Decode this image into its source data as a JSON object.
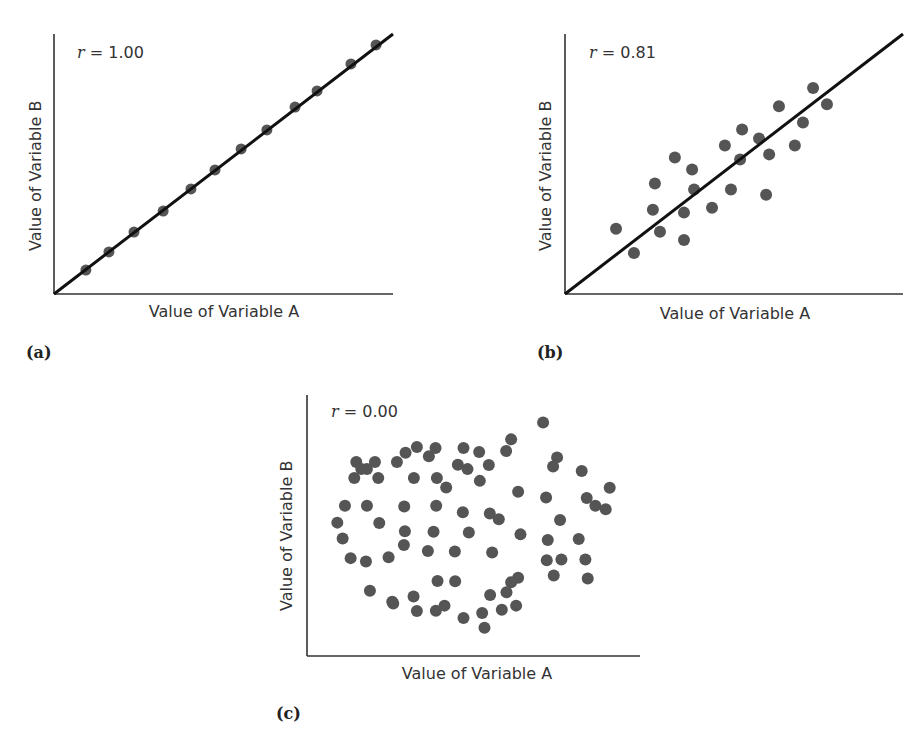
{
  "figure": {
    "panels": [
      {
        "tag": "(a)",
        "r_var": "r",
        "r_value": "= 1.00",
        "xlabel": "Value of Variable A",
        "ylabel": "Value of Variable B"
      },
      {
        "tag": "(b)",
        "r_var": "r",
        "r_value": "= 0.81",
        "xlabel": "Value of Variable A",
        "ylabel": "Value of Variable B"
      },
      {
        "tag": "(c)",
        "r_var": "r",
        "r_value": "= 0.00",
        "xlabel": "Value of Variable A",
        "ylabel": "Value of Variable B"
      }
    ],
    "colors": {
      "point": "#555555",
      "line": "#111111",
      "axis": "#333333"
    }
  },
  "chart_data": [
    {
      "type": "scatter",
      "title": "r = 1.00",
      "panel": "(a)",
      "xlabel": "Value of Variable A",
      "ylabel": "Value of Variable B",
      "xlim": [
        0,
        100
      ],
      "ylim": [
        0,
        100
      ],
      "grid": false,
      "ticks": false,
      "regression_line": {
        "x": [
          0,
          100
        ],
        "y": [
          0,
          100
        ]
      },
      "points": [
        {
          "x": 9.4,
          "y": 9.2
        },
        {
          "x": 16.2,
          "y": 16.2
        },
        {
          "x": 23.6,
          "y": 23.8
        },
        {
          "x": 32.2,
          "y": 31.9
        },
        {
          "x": 40.4,
          "y": 40.4
        },
        {
          "x": 47.5,
          "y": 47.7
        },
        {
          "x": 55.2,
          "y": 55.8
        },
        {
          "x": 62.8,
          "y": 63.1
        },
        {
          "x": 71.1,
          "y": 71.9
        },
        {
          "x": 77.6,
          "y": 78.1
        },
        {
          "x": 87.6,
          "y": 88.5
        },
        {
          "x": 95.0,
          "y": 95.8
        }
      ]
    },
    {
      "type": "scatter",
      "title": "r = 0.81",
      "panel": "(b)",
      "xlabel": "Value of Variable A",
      "ylabel": "Value of Variable B",
      "xlim": [
        0,
        100
      ],
      "ylim": [
        0,
        100
      ],
      "grid": false,
      "ticks": false,
      "regression_line": {
        "x": [
          0,
          100
        ],
        "y": [
          0,
          100
        ]
      },
      "points": [
        {
          "x": 15.1,
          "y": 25.1
        },
        {
          "x": 20.4,
          "y": 15.8
        },
        {
          "x": 26.0,
          "y": 32.4
        },
        {
          "x": 26.6,
          "y": 42.5
        },
        {
          "x": 28.1,
          "y": 23.9
        },
        {
          "x": 32.5,
          "y": 52.5
        },
        {
          "x": 35.2,
          "y": 20.8
        },
        {
          "x": 35.2,
          "y": 31.3
        },
        {
          "x": 37.6,
          "y": 47.9
        },
        {
          "x": 38.2,
          "y": 40.2
        },
        {
          "x": 43.5,
          "y": 33.2
        },
        {
          "x": 47.3,
          "y": 57.1
        },
        {
          "x": 49.1,
          "y": 40.2
        },
        {
          "x": 51.8,
          "y": 51.7
        },
        {
          "x": 52.4,
          "y": 63.3
        },
        {
          "x": 57.4,
          "y": 59.8
        },
        {
          "x": 59.5,
          "y": 38.2
        },
        {
          "x": 60.4,
          "y": 53.7
        },
        {
          "x": 63.3,
          "y": 72.2
        },
        {
          "x": 68.0,
          "y": 57.1
        },
        {
          "x": 70.4,
          "y": 66.0
        },
        {
          "x": 73.4,
          "y": 79.2
        },
        {
          "x": 77.5,
          "y": 73.0
        }
      ]
    },
    {
      "type": "scatter",
      "title": "r = 0.00",
      "panel": "(c)",
      "xlabel": "Value of Variable A",
      "ylabel": "Value of Variable B",
      "xlim": [
        0,
        100
      ],
      "ylim": [
        0,
        100
      ],
      "grid": false,
      "ticks": false,
      "regression_line": null,
      "points": [
        {
          "x": 70.9,
          "y": 89.5
        },
        {
          "x": 61.3,
          "y": 83.0
        },
        {
          "x": 59.8,
          "y": 78.5
        },
        {
          "x": 47.0,
          "y": 79.7
        },
        {
          "x": 51.7,
          "y": 78.2
        },
        {
          "x": 38.6,
          "y": 79.7
        },
        {
          "x": 33.0,
          "y": 80.1
        },
        {
          "x": 29.6,
          "y": 77.9
        },
        {
          "x": 36.6,
          "y": 76.5
        },
        {
          "x": 27.0,
          "y": 74.3
        },
        {
          "x": 20.4,
          "y": 74.3
        },
        {
          "x": 14.8,
          "y": 74.3
        },
        {
          "x": 16.3,
          "y": 71.6
        },
        {
          "x": 18.0,
          "y": 71.6
        },
        {
          "x": 45.3,
          "y": 73.3
        },
        {
          "x": 48.2,
          "y": 71.6
        },
        {
          "x": 54.6,
          "y": 73.2
        },
        {
          "x": 75.1,
          "y": 76.1
        },
        {
          "x": 73.9,
          "y": 72.6
        },
        {
          "x": 82.5,
          "y": 70.9
        },
        {
          "x": 14.2,
          "y": 68.2
        },
        {
          "x": 21.4,
          "y": 68.2
        },
        {
          "x": 32.1,
          "y": 68.2
        },
        {
          "x": 39.0,
          "y": 68.2
        },
        {
          "x": 41.8,
          "y": 64.6
        },
        {
          "x": 51.9,
          "y": 67.1
        },
        {
          "x": 63.4,
          "y": 62.9
        },
        {
          "x": 71.8,
          "y": 60.7
        },
        {
          "x": 84.0,
          "y": 60.5
        },
        {
          "x": 86.6,
          "y": 57.6
        },
        {
          "x": 90.9,
          "y": 64.5
        },
        {
          "x": 89.7,
          "y": 56.2
        },
        {
          "x": 11.4,
          "y": 57.6
        },
        {
          "x": 18.0,
          "y": 57.6
        },
        {
          "x": 29.2,
          "y": 57.3
        },
        {
          "x": 38.8,
          "y": 57.6
        },
        {
          "x": 46.8,
          "y": 55.1
        },
        {
          "x": 54.9,
          "y": 54.6
        },
        {
          "x": 57.6,
          "y": 52.4
        },
        {
          "x": 76.0,
          "y": 52.1
        },
        {
          "x": 9.1,
          "y": 51.1
        },
        {
          "x": 21.7,
          "y": 51.0
        },
        {
          "x": 29.4,
          "y": 47.8
        },
        {
          "x": 38.0,
          "y": 47.6
        },
        {
          "x": 48.6,
          "y": 47.3
        },
        {
          "x": 64.1,
          "y": 46.6
        },
        {
          "x": 72.3,
          "y": 44.4
        },
        {
          "x": 81.6,
          "y": 44.8
        },
        {
          "x": 10.7,
          "y": 45.0
        },
        {
          "x": 29.1,
          "y": 42.5
        },
        {
          "x": 36.3,
          "y": 40.2
        },
        {
          "x": 44.4,
          "y": 40.0
        },
        {
          "x": 55.6,
          "y": 39.7
        },
        {
          "x": 72.0,
          "y": 36.7
        },
        {
          "x": 76.4,
          "y": 37.0
        },
        {
          "x": 83.6,
          "y": 37.0
        },
        {
          "x": 13.1,
          "y": 37.5
        },
        {
          "x": 17.7,
          "y": 36.2
        },
        {
          "x": 24.5,
          "y": 37.8
        },
        {
          "x": 44.5,
          "y": 28.6
        },
        {
          "x": 39.2,
          "y": 28.7
        },
        {
          "x": 63.4,
          "y": 30.0
        },
        {
          "x": 74.1,
          "y": 30.8
        },
        {
          "x": 84.3,
          "y": 29.7
        },
        {
          "x": 18.9,
          "y": 25.0
        },
        {
          "x": 25.6,
          "y": 20.8
        },
        {
          "x": 32.0,
          "y": 22.8
        },
        {
          "x": 55.0,
          "y": 23.4
        },
        {
          "x": 61.3,
          "y": 28.3
        },
        {
          "x": 41.3,
          "y": 19.3
        },
        {
          "x": 52.6,
          "y": 16.5
        },
        {
          "x": 62.8,
          "y": 19.3
        },
        {
          "x": 53.3,
          "y": 10.8
        },
        {
          "x": 47.0,
          "y": 14.6
        },
        {
          "x": 38.7,
          "y": 17.3
        },
        {
          "x": 33.0,
          "y": 17.2
        },
        {
          "x": 25.9,
          "y": 20.1
        },
        {
          "x": 59.9,
          "y": 24.4
        },
        {
          "x": 58.5,
          "y": 17.7
        }
      ]
    }
  ]
}
